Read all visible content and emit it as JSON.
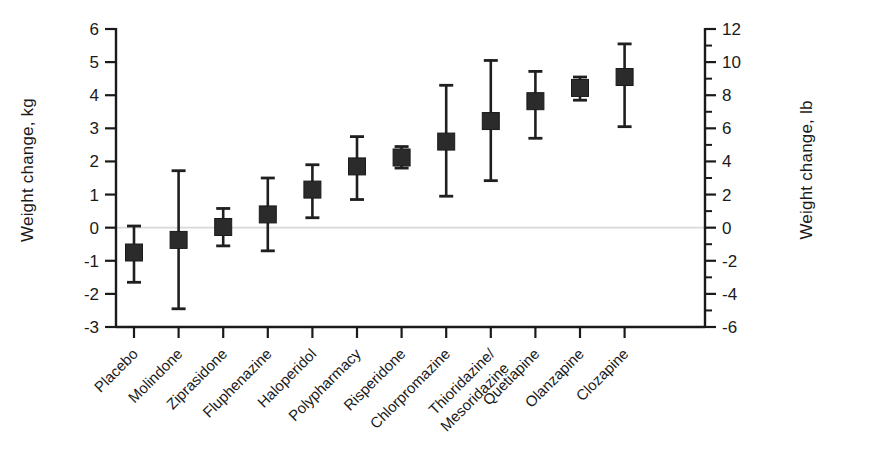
{
  "chart_data": {
    "type": "scatter",
    "title": "",
    "subtitle": "",
    "ylabel": "Weight change, kg",
    "ylabel_secondary": "Weight change, lb",
    "xlabel": "",
    "grid": false,
    "legend": "none",
    "marker": "filled-square",
    "error_bars": "95% CI",
    "zero_reference_line": true,
    "ylim": [
      -3,
      6
    ],
    "yticks": [
      -3,
      -2,
      -1,
      0,
      1,
      2,
      3,
      4,
      5,
      6
    ],
    "ytick_labels": [
      "-3",
      "-2",
      "-1",
      "0",
      "1",
      "2",
      "3",
      "4",
      "5",
      "6"
    ],
    "ylim_secondary": [
      -6,
      12
    ],
    "yticks_secondary": [
      -6,
      -4,
      -2,
      0,
      2,
      4,
      6,
      8,
      10,
      12
    ],
    "ytick_labels_secondary": [
      "-6",
      "-4",
      "-2",
      "0",
      "2",
      "4",
      "6",
      "8",
      "10",
      "12"
    ],
    "yticks_secondary_minor": [
      -5,
      -3,
      -1,
      1,
      3,
      5,
      7,
      9,
      11
    ],
    "categories": [
      "Placebo",
      "Molindone",
      "Ziprasidone",
      "Fluphenazine",
      "Haloperidol",
      "Polypharmacy",
      "Risperidone",
      "Chlorpromazine",
      "Thioridazine/ Mesoridazine",
      "Quetiapine",
      "Olanzapine",
      "Clozapine"
    ],
    "category_labels_wrapped": [
      [
        "Placebo"
      ],
      [
        "Molindone"
      ],
      [
        "Ziprasidone"
      ],
      [
        "Fluphenazine"
      ],
      [
        "Haloperidol"
      ],
      [
        "Polypharmacy"
      ],
      [
        "Risperidone"
      ],
      [
        "Chlorpromazine"
      ],
      [
        "Thioridazine/",
        "Mesoridazine"
      ],
      [
        "Quetiapine"
      ],
      [
        "Olanzapine"
      ],
      [
        "Clozapine"
      ]
    ],
    "values": [
      -0.75,
      -0.37,
      0.02,
      0.4,
      1.15,
      1.85,
      2.12,
      2.6,
      3.22,
      3.82,
      4.22,
      4.55
    ],
    "ci_low": [
      -1.65,
      -2.45,
      -0.55,
      -0.7,
      0.3,
      0.85,
      1.8,
      0.95,
      1.42,
      2.7,
      3.85,
      3.05
    ],
    "ci_high": [
      0.05,
      1.72,
      0.58,
      1.5,
      1.9,
      2.75,
      2.45,
      4.3,
      5.05,
      4.72,
      4.55,
      5.55
    ],
    "series": [
      {
        "name": "Mean weight change with 95% CI",
        "points": [
          {
            "category": "Placebo",
            "value": -0.75,
            "ci_low": -1.65,
            "ci_high": 0.05
          },
          {
            "category": "Molindone",
            "value": -0.37,
            "ci_low": -2.45,
            "ci_high": 1.72
          },
          {
            "category": "Ziprasidone",
            "value": 0.02,
            "ci_low": -0.55,
            "ci_high": 0.58
          },
          {
            "category": "Fluphenazine",
            "value": 0.4,
            "ci_low": -0.7,
            "ci_high": 1.5
          },
          {
            "category": "Haloperidol",
            "value": 1.15,
            "ci_low": 0.3,
            "ci_high": 1.9
          },
          {
            "category": "Polypharmacy",
            "value": 1.85,
            "ci_low": 0.85,
            "ci_high": 2.75
          },
          {
            "category": "Risperidone",
            "value": 2.12,
            "ci_low": 1.8,
            "ci_high": 2.45
          },
          {
            "category": "Chlorpromazine",
            "value": 2.6,
            "ci_low": 0.95,
            "ci_high": 4.3
          },
          {
            "category": "Thioridazine/ Mesoridazine",
            "value": 3.22,
            "ci_low": 1.42,
            "ci_high": 5.05
          },
          {
            "category": "Quetiapine",
            "value": 3.82,
            "ci_low": 2.7,
            "ci_high": 4.72
          },
          {
            "category": "Olanzapine",
            "value": 4.22,
            "ci_low": 3.85,
            "ci_high": 4.55
          },
          {
            "category": "Clozapine",
            "value": 4.55,
            "ci_low": 3.05,
            "ci_high": 5.55
          }
        ]
      }
    ],
    "colors": {
      "marker": "#2b2b2b",
      "error_bar": "#1f1f1f",
      "axis": "#1a1a1a",
      "zero_line": "#d8d8d8",
      "background": "#ffffff",
      "text": "#1a1a1a"
    }
  }
}
